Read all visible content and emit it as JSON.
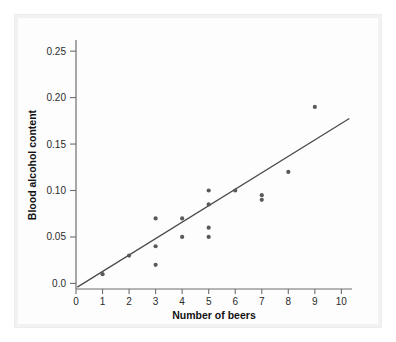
{
  "chart_data": {
    "type": "scatter",
    "title": "",
    "subtitle": "",
    "xlabel": "Number of beers",
    "ylabel": "Blood alcohol content",
    "xlim": [
      0,
      10.4
    ],
    "ylim": [
      -0.006,
      0.262
    ],
    "grid": false,
    "legend": null,
    "x_ticks": [
      0,
      1,
      2,
      3,
      4,
      5,
      6,
      7,
      8,
      9,
      10
    ],
    "x_tick_labels": [
      "0",
      "1",
      "2",
      "3",
      "4",
      "5",
      "6",
      "7",
      "8",
      "9",
      "10"
    ],
    "y_ticks": [
      0.0,
      0.05,
      0.1,
      0.15,
      0.2,
      0.25
    ],
    "y_tick_labels": [
      "0.0",
      "0.05",
      "0.10",
      "0.15",
      "0.20",
      "0.25"
    ],
    "marker": "filled-circle",
    "marker_color": "#5a5a5a",
    "points": [
      {
        "x": 1,
        "y": 0.01
      },
      {
        "x": 2,
        "y": 0.03
      },
      {
        "x": 3,
        "y": 0.07
      },
      {
        "x": 3,
        "y": 0.04
      },
      {
        "x": 3,
        "y": 0.02
      },
      {
        "x": 4,
        "y": 0.07
      },
      {
        "x": 4,
        "y": 0.05
      },
      {
        "x": 5,
        "y": 0.1
      },
      {
        "x": 5,
        "y": 0.085
      },
      {
        "x": 5,
        "y": 0.06
      },
      {
        "x": 5,
        "y": 0.05
      },
      {
        "x": 6,
        "y": 0.1
      },
      {
        "x": 7,
        "y": 0.095
      },
      {
        "x": 7,
        "y": 0.09
      },
      {
        "x": 8,
        "y": 0.12
      },
      {
        "x": 9,
        "y": 0.19
      }
    ],
    "fit_line": {
      "type": "linear-regression",
      "color": "#4a4a4a",
      "x_start": 0.05,
      "y_start": -0.004,
      "x_end": 10.3,
      "y_end": 0.1775
    }
  },
  "axes": {
    "x_title": "Number of beers",
    "y_title": "Blood alcohol content"
  },
  "colors": {
    "marker": "#5a5a5a",
    "line": "#4a4a4a",
    "axis": "#6d6d6d",
    "page_frame": "#f2f2f2",
    "card": "#fdfdfd"
  }
}
